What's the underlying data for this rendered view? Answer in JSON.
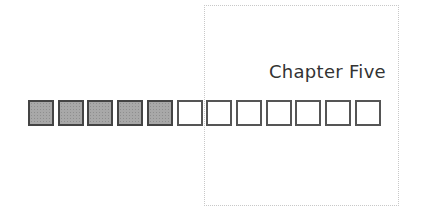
{
  "title": "Chapter Five",
  "progress": {
    "total": 12,
    "filled": 5,
    "cells": [
      {
        "state": "filled"
      },
      {
        "state": "filled"
      },
      {
        "state": "filled"
      },
      {
        "state": "filled"
      },
      {
        "state": "filled"
      },
      {
        "state": "empty"
      },
      {
        "state": "empty"
      },
      {
        "state": "empty"
      },
      {
        "state": "empty"
      },
      {
        "state": "empty"
      },
      {
        "state": "empty"
      },
      {
        "state": "empty"
      }
    ]
  },
  "colors": {
    "filled_cell": "#a8a8a8",
    "empty_cell": "#ffffff",
    "cell_border": "#555555",
    "frame_border": "#c8c8c8",
    "title_text": "#333333"
  }
}
